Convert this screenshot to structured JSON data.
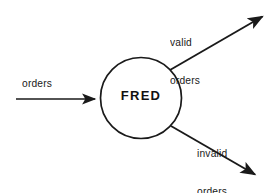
{
  "diagram": {
    "type": "data-flow-diagram",
    "background_color": "#ffffff",
    "stroke_color": "#1a1a1a",
    "process": {
      "label": "FRED",
      "shape": "circle",
      "center_x": 141,
      "center_y": 98,
      "radius": 41
    },
    "flows": [
      {
        "id": "input-orders",
        "label": "orders",
        "direction": "in",
        "from": {
          "x": 16,
          "y": 99
        },
        "to": {
          "x": 101,
          "y": 99
        }
      },
      {
        "id": "output-valid-orders",
        "label_line1": "valid",
        "label_line2": "orders",
        "label": "valid orders",
        "direction": "out",
        "from": {
          "x": 170,
          "y": 70
        },
        "to": {
          "x": 268,
          "y": 13
        }
      },
      {
        "id": "output-invalid-orders",
        "label_line1": "invalid",
        "label_line2": "orders",
        "label": "invalid orders",
        "direction": "out",
        "from": {
          "x": 171,
          "y": 126
        },
        "to": {
          "x": 261,
          "y": 179
        }
      }
    ]
  }
}
